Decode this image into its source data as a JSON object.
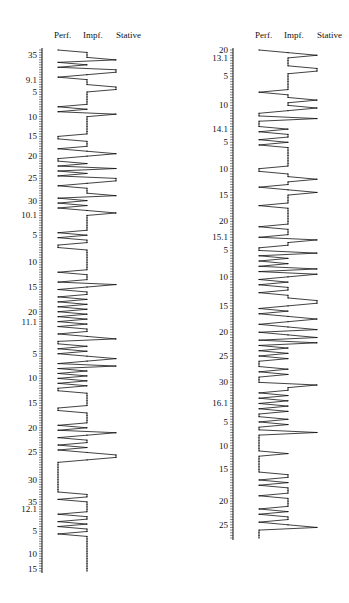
{
  "chart_data": [
    {
      "type": "line",
      "orientation": "vertical",
      "title": "",
      "categories": [
        "Perf.",
        "Impf.",
        "Stative"
      ],
      "category_codes": {
        "Perf.": 0,
        "Impf.": 1,
        "Stative": 2
      },
      "tick_labels": [
        {
          "label": "35",
          "index": 2
        },
        {
          "label": "9.1",
          "index": 12
        },
        {
          "label": "5",
          "index": 17
        },
        {
          "label": "10",
          "index": 27
        },
        {
          "label": "15",
          "index": 35
        },
        {
          "label": "20",
          "index": 43
        },
        {
          "label": "25",
          "index": 52
        },
        {
          "label": "30",
          "index": 61
        },
        {
          "label": "10.1",
          "index": 67
        },
        {
          "label": "5",
          "index": 75
        },
        {
          "label": "10",
          "index": 86
        },
        {
          "label": "15",
          "index": 96
        },
        {
          "label": "20",
          "index": 106
        },
        {
          "label": "11.1",
          "index": 110
        },
        {
          "label": "5",
          "index": 123
        },
        {
          "label": "10",
          "index": 133
        },
        {
          "label": "15",
          "index": 143
        },
        {
          "label": "20",
          "index": 153
        },
        {
          "label": "25",
          "index": 163
        },
        {
          "label": "30",
          "index": 174
        },
        {
          "label": "35",
          "index": 183
        },
        {
          "label": "12.1",
          "index": 186
        },
        {
          "label": "5",
          "index": 195
        },
        {
          "label": "10",
          "index": 204
        },
        {
          "label": "15",
          "index": 210
        }
      ],
      "n_points": 212,
      "values": [
        0,
        1,
        1,
        1,
        2,
        0,
        1,
        0,
        2,
        2,
        1,
        0,
        1,
        1,
        1,
        2,
        2,
        1,
        1,
        1,
        1,
        1,
        1,
        0,
        1,
        0,
        2,
        1,
        1,
        1,
        1,
        1,
        1,
        1,
        1,
        0,
        0,
        1,
        1,
        1,
        0,
        1,
        2,
        1,
        0,
        0,
        1,
        0,
        2,
        0,
        1,
        0,
        2,
        2,
        1,
        0,
        1,
        1,
        1,
        2,
        0,
        1,
        0,
        1,
        0,
        1,
        2,
        1,
        1,
        1,
        1,
        1,
        1,
        1,
        0,
        1,
        0,
        1,
        1,
        0,
        0,
        1,
        1,
        1,
        1,
        1,
        1,
        1,
        1,
        1,
        0,
        1,
        1,
        1,
        0,
        2,
        1,
        0,
        1,
        1,
        0,
        1,
        0,
        1,
        0,
        1,
        0,
        1,
        0,
        1,
        0,
        1,
        0,
        1,
        1,
        0,
        1,
        2,
        0,
        0,
        1,
        0,
        1,
        0,
        1,
        2,
        1,
        0,
        2,
        0,
        1,
        0,
        1,
        0,
        1,
        0,
        1,
        0,
        0,
        1,
        1,
        1,
        1,
        1,
        1,
        0,
        0,
        1,
        1,
        1,
        1,
        1,
        0,
        1,
        0,
        2,
        1,
        0,
        1,
        1,
        0,
        1,
        0,
        1,
        2,
        2,
        1,
        0,
        0,
        0,
        0,
        0,
        0,
        0,
        0,
        0,
        0,
        0,
        0,
        0,
        1,
        1,
        0,
        1,
        1,
        1,
        1,
        1,
        0,
        1,
        1,
        0,
        1,
        0,
        1,
        1,
        0,
        1,
        1,
        1,
        1,
        1,
        1,
        1,
        1,
        1,
        1,
        1,
        1,
        1,
        1,
        1
      ]
    },
    {
      "type": "line",
      "orientation": "vertical",
      "title": "",
      "categories": [
        "Perf.",
        "Impf.",
        "Stative"
      ],
      "category_codes": {
        "Perf.": 0,
        "Impf.": 1,
        "Stative": 2
      },
      "tick_labels": [
        {
          "label": "20",
          "index": 0
        },
        {
          "label": "13.1",
          "index": 3
        },
        {
          "label": "5",
          "index": 10
        },
        {
          "label": "10",
          "index": 21
        },
        {
          "label": "14.1",
          "index": 30
        },
        {
          "label": "5",
          "index": 35
        },
        {
          "label": "10",
          "index": 45
        },
        {
          "label": "15",
          "index": 55
        },
        {
          "label": "20",
          "index": 65
        },
        {
          "label": "15.1",
          "index": 71
        },
        {
          "label": "5",
          "index": 76
        },
        {
          "label": "10",
          "index": 86
        },
        {
          "label": "15",
          "index": 97
        },
        {
          "label": "20",
          "index": 107
        },
        {
          "label": "25",
          "index": 116
        },
        {
          "label": "30",
          "index": 126
        },
        {
          "label": "16.1",
          "index": 134
        },
        {
          "label": "5",
          "index": 141
        },
        {
          "label": "10",
          "index": 150
        },
        {
          "label": "15",
          "index": 159
        },
        {
          "label": "20",
          "index": 171
        },
        {
          "label": "25",
          "index": 180
        }
      ],
      "n_points": 186,
      "values": [
        0,
        1,
        2,
        1,
        1,
        1,
        1,
        2,
        2,
        1,
        1,
        1,
        1,
        1,
        1,
        1,
        0,
        1,
        1,
        2,
        1,
        1,
        2,
        1,
        0,
        0,
        2,
        0,
        0,
        0,
        1,
        0,
        1,
        1,
        0,
        1,
        0,
        1,
        1,
        1,
        1,
        1,
        1,
        1,
        1,
        0,
        0,
        1,
        1,
        2,
        1,
        1,
        0,
        1,
        2,
        1,
        1,
        1,
        1,
        0,
        1,
        1,
        1,
        1,
        1,
        1,
        1,
        0,
        1,
        1,
        1,
        0,
        2,
        1,
        1,
        0,
        0,
        2,
        0,
        1,
        0,
        1,
        0,
        2,
        0,
        2,
        1,
        0,
        1,
        0,
        1,
        1,
        0,
        1,
        1,
        2,
        2,
        1,
        0,
        1,
        0,
        1,
        2,
        1,
        0,
        1,
        2,
        0,
        1,
        2,
        0,
        2,
        0,
        1,
        0,
        1,
        0,
        1,
        0,
        0,
        0,
        1,
        0,
        1,
        0,
        0,
        0,
        2,
        1,
        1,
        0,
        1,
        0,
        1,
        0,
        1,
        0,
        1,
        0,
        0,
        1,
        0,
        1,
        0,
        0,
        2,
        0,
        0,
        0,
        0,
        0,
        0,
        0,
        1,
        0,
        0,
        0,
        0,
        0,
        0,
        0,
        1,
        1,
        0,
        1,
        0,
        1,
        1,
        1,
        0,
        1,
        1,
        1,
        1,
        0,
        1,
        0,
        1,
        1,
        0,
        1,
        2,
        0,
        0,
        0,
        0
      ]
    }
  ]
}
